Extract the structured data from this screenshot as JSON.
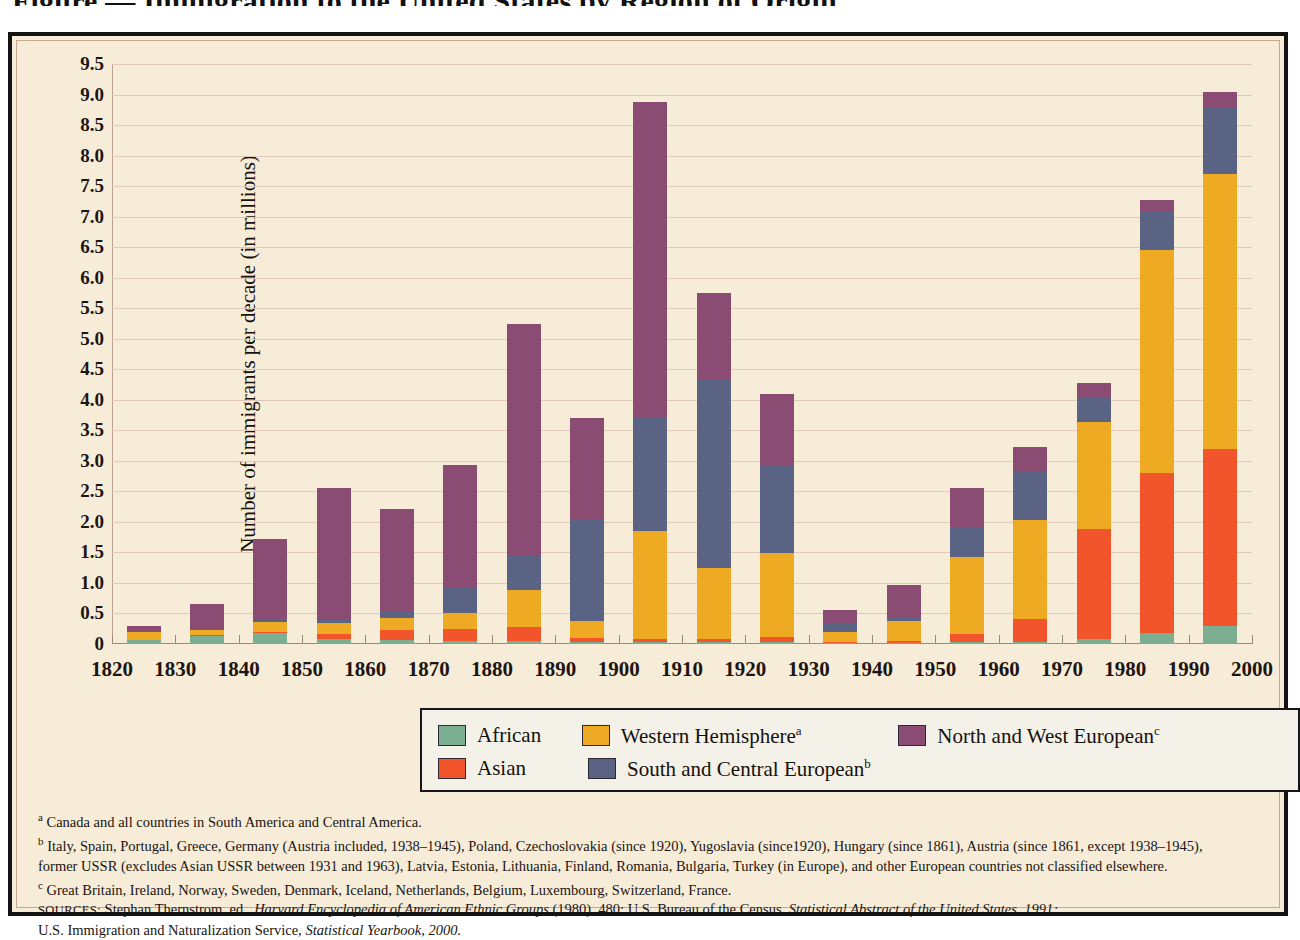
{
  "figure": {
    "title": "Figure — Immigration to the United States by Region of Origin"
  },
  "chart_data": {
    "type": "bar",
    "stacked": true,
    "title": "",
    "xlabel": "",
    "ylabel": "Number of immigrants per decade (in millions)",
    "ylim": [
      0,
      9.5
    ],
    "ytick_labels": [
      "9.5",
      "9.0",
      "8.5",
      "8.0",
      "7.5",
      "7.0",
      "6.5",
      "6.0",
      "5.5",
      "5.0",
      "4.5",
      "4.0",
      "3.5",
      "3.0",
      "2.5",
      "2.0",
      "1.5",
      "1.0",
      "0.5",
      "0"
    ],
    "ytick_values": [
      9.5,
      9.0,
      8.5,
      8.0,
      7.5,
      7.0,
      6.5,
      6.0,
      5.5,
      5.0,
      4.5,
      4.0,
      3.5,
      3.0,
      2.5,
      2.0,
      1.5,
      1.0,
      0.5,
      0
    ],
    "xtick_labels": [
      "1820",
      "1830",
      "1840",
      "1850",
      "1860",
      "1870",
      "1880",
      "1890",
      "1900",
      "1910",
      "1920",
      "1930",
      "1940",
      "1950",
      "1960",
      "1970",
      "1980",
      "1990",
      "2000"
    ],
    "xtick_values": [
      1820,
      1830,
      1840,
      1850,
      1860,
      1870,
      1880,
      1890,
      1900,
      1910,
      1920,
      1930,
      1940,
      1950,
      1960,
      1970,
      1980,
      1990,
      2000
    ],
    "grid": true,
    "legend_position": "below-center",
    "categories": [
      "1821-1830",
      "1831-1840",
      "1841-1850",
      "1851-1860",
      "1861-1870",
      "1871-1880",
      "1881-1890",
      "1891-1900",
      "1901-1910",
      "1911-1920",
      "1921-1930",
      "1931-1940",
      "1941-1950",
      "1951-1960",
      "1961-1970",
      "1971-1980",
      "1981-1990",
      "1991-2000"
    ],
    "bar_centers": [
      1825,
      1835,
      1845,
      1855,
      1865,
      1875,
      1885,
      1895,
      1905,
      1915,
      1925,
      1935,
      1945,
      1955,
      1965,
      1975,
      1985,
      1995
    ],
    "series": [
      {
        "name": "African",
        "color": "#7cae92",
        "values": [
          0.06,
          0.13,
          0.18,
          0.08,
          0.06,
          0.05,
          0.05,
          0.04,
          0.03,
          0.03,
          0.03,
          0.02,
          0.02,
          0.03,
          0.04,
          0.08,
          0.18,
          0.3
        ]
      },
      {
        "name": "Asian",
        "color": "#f2552b",
        "values": [
          0.0,
          0.01,
          0.01,
          0.09,
          0.17,
          0.19,
          0.23,
          0.06,
          0.05,
          0.06,
          0.09,
          0.02,
          0.03,
          0.13,
          0.37,
          1.8,
          2.62,
          2.9
        ]
      },
      {
        "name": "Western Hemisphere",
        "color": "#eeaa22",
        "values": [
          0.14,
          0.09,
          0.17,
          0.17,
          0.2,
          0.27,
          0.6,
          0.27,
          1.77,
          1.15,
          1.37,
          0.16,
          0.32,
          1.27,
          1.62,
          1.75,
          3.65,
          4.5
        ]
      },
      {
        "name": "South and Central European",
        "color": "#5a6383",
        "values": [
          0.01,
          0.02,
          0.03,
          0.06,
          0.1,
          0.4,
          0.57,
          1.68,
          1.85,
          3.1,
          1.45,
          0.13,
          0.07,
          0.48,
          0.8,
          0.4,
          0.65,
          1.1
        ]
      },
      {
        "name": "North and West European",
        "color": "#8b4c73",
        "values": [
          0.09,
          0.4,
          1.33,
          2.16,
          1.69,
          2.03,
          3.8,
          1.65,
          5.17,
          1.41,
          1.16,
          0.22,
          0.52,
          0.64,
          0.4,
          0.24,
          0.17,
          0.25
        ]
      }
    ],
    "bar_totals": [
      0.3,
      0.65,
      1.72,
      2.56,
      2.22,
      2.94,
      5.25,
      3.7,
      8.87,
      5.75,
      4.1,
      0.55,
      0.96,
      2.55,
      3.23,
      4.27,
      7.27,
      9.05
    ]
  },
  "legend": {
    "items": [
      {
        "label": "African",
        "sup": "",
        "color": "#7cae92",
        "name": "legend-african"
      },
      {
        "label": "Western Hemisphere",
        "sup": "a",
        "color": "#eeaa22",
        "name": "legend-western-hemisphere"
      },
      {
        "label": "North and West European",
        "sup": "c",
        "color": "#8b4c73",
        "name": "legend-north-west-european"
      },
      {
        "label": "Asian",
        "sup": "",
        "color": "#f2552b",
        "name": "legend-asian"
      },
      {
        "label": "South and Central European",
        "sup": "b",
        "color": "#5a6383",
        "name": "legend-south-central-european"
      }
    ]
  },
  "notes": {
    "a_marker": "a",
    "a_text": "Canada and all countries in South America and Central America.",
    "b_marker": "b",
    "b_text_line1": "Italy, Spain, Portugal, Greece, Germany (Austria included, 1938–1945), Poland, Czechoslovakia (since 1920), Yugoslavia (since1920), Hungary (since 1861), Austria (since 1861, except 1938–1945),",
    "b_text_line2": "former USSR (excludes Asian USSR between 1931 and 1963), Latvia, Estonia, Lithuania, Finland, Romania, Bulgaria, Turkey (in Europe), and other European countries not classified elsewhere.",
    "c_marker": "c",
    "c_text": "Great Britain, Ireland, Norway, Sweden, Denmark, Iceland, Netherlands, Belgium, Luxembourg, Switzerland, France.",
    "sources_label": "SOURCES:",
    "sources_line1_a": "Stephan Thernstrom, ed.,",
    "sources_line1_italic1": "Harvard Encyclopedia of American Ethnic Groups",
    "sources_line1_b": "(1980), 480; U.S. Bureau of the Census,",
    "sources_line1_italic2": "Statistical Abstract of the United States, 1991;",
    "sources_line2_a": "U.S. Immigration and Naturalization Service,",
    "sources_line2_italic": "Statistical Yearbook, 2000."
  }
}
